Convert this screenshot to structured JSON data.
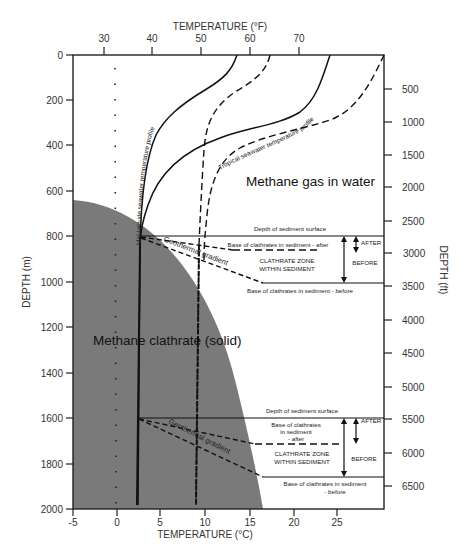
{
  "diagram": {
    "top_axis": {
      "title": "TEMPERATURE (°F)",
      "ticks": [
        "30",
        "40",
        "50",
        "60",
        "70"
      ]
    },
    "bottom_axis": {
      "title": "TEMPERATURE (°C)",
      "ticks": [
        "-5",
        "0",
        "5",
        "10",
        "15",
        "20",
        "25"
      ]
    },
    "left_axis": {
      "title": "DEPTH (m)",
      "ticks": [
        "0",
        "200",
        "400",
        "600",
        "800",
        "1000",
        "1200",
        "1400",
        "1600",
        "1800",
        "2000"
      ]
    },
    "right_axis": {
      "title": "DEPTH (ft)",
      "ticks": [
        "500",
        "1000",
        "1500",
        "2000",
        "2500",
        "3000",
        "3500",
        "4000",
        "4500",
        "5000",
        "5500",
        "6000",
        "6500"
      ]
    },
    "regions": {
      "gas": "Methane gas in water",
      "solid": "Methane clathrate (solid)"
    },
    "curve_labels": {
      "mid_latitude": "Mid-latitude seawater temperature profile",
      "tropical": "Tropical seawater temperature profile",
      "geothermal_upper": "Geothermal gradient",
      "geothermal_lower": "Geothermal gradient"
    },
    "upper_case": {
      "sediment_surface": "Depth of sediment surface",
      "base_after": "Base of clathrates in sediment - after",
      "zone_line1": "CLATHRATE ZONE",
      "zone_line2": "WITHIN SEDIMENT",
      "base_before": "Base of clathrates in sediment - before",
      "after_label": "AFTER",
      "before_label": "BEFORE"
    },
    "lower_case": {
      "sediment_surface": "Depth of sediment surface",
      "base_after_line1": "Base of clathrates",
      "base_after_line2": "in sediment",
      "base_after_line3": "- after",
      "zone_line1": "CLATHRATE ZONE",
      "zone_line2": "WITHIN SEDIMENT",
      "base_before_line1": "Base of clathrates in sediment",
      "base_before_line2": "- before",
      "after_label": "AFTER",
      "before_label": "BEFORE"
    },
    "colors": {
      "clathrate_fill": "#7a7a7a",
      "line": "#111111",
      "background": "#ffffff"
    }
  }
}
